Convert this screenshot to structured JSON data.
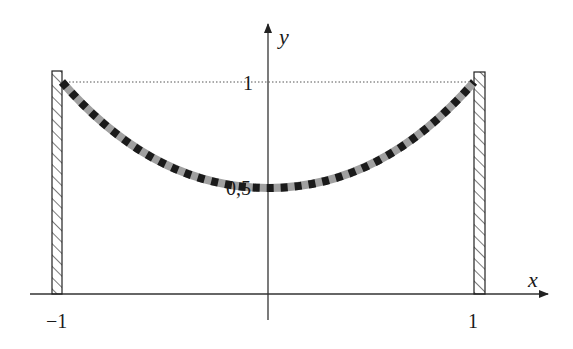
{
  "diagram": {
    "axes": {
      "x_label": "x",
      "y_label": "y"
    },
    "ticks": {
      "x_left": "−1",
      "x_right": "1",
      "y_top": "1",
      "y_mid": "0,5"
    },
    "walls": [
      {
        "name": "left-wall",
        "x": -1
      },
      {
        "name": "right-wall",
        "x": 1
      }
    ],
    "curve": {
      "endpoints_y": 1,
      "minimum_y": 0.5,
      "style": "dashed black over grey"
    },
    "colors": {
      "axis": "#333333",
      "curve_base": "#a0a0a0",
      "curve_dash": "#1a1a1a",
      "dotted_line": "#555555"
    }
  }
}
